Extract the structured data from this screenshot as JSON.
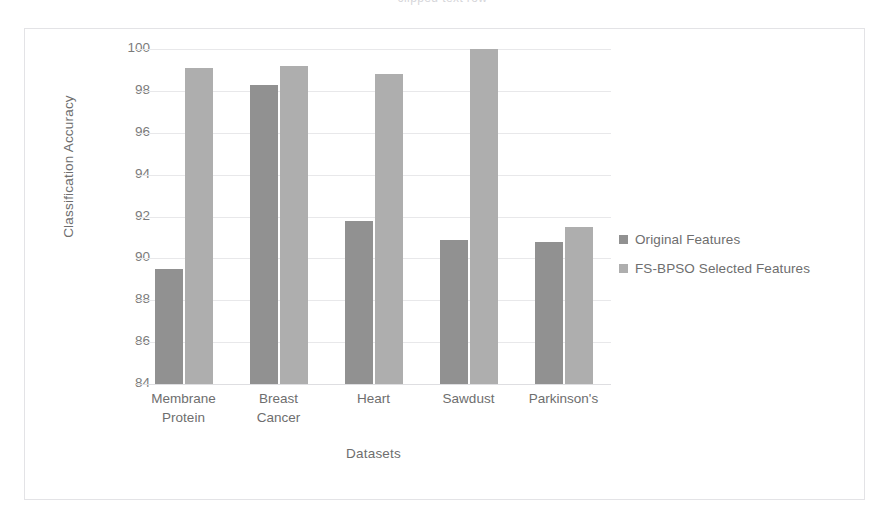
{
  "clipped_caption": "clipped text row",
  "chart_data": {
    "type": "bar",
    "title": "",
    "xlabel": "Datasets",
    "ylabel": "Classification Accuracy",
    "categories": [
      "Membrane\nProtein",
      "Breast\nCancer",
      "Heart",
      "Sawdust",
      "Parkinson's"
    ],
    "series": [
      {
        "name": "Original Features",
        "color": "#919191",
        "values": [
          89.5,
          98.3,
          91.8,
          90.9,
          90.8
        ]
      },
      {
        "name": "FS-BPSO Selected Features",
        "color": "#aeaeae",
        "values": [
          99.1,
          99.2,
          98.8,
          100.1,
          91.5
        ]
      }
    ],
    "ylim": [
      84,
      100
    ],
    "yticks": [
      100,
      98,
      96,
      94,
      92,
      90,
      88,
      86,
      84
    ],
    "ytick_labels": [
      "100",
      "98",
      "96",
      "94",
      "92",
      "90",
      "88",
      "86",
      "84"
    ],
    "grid": true,
    "legend_position": "right"
  }
}
